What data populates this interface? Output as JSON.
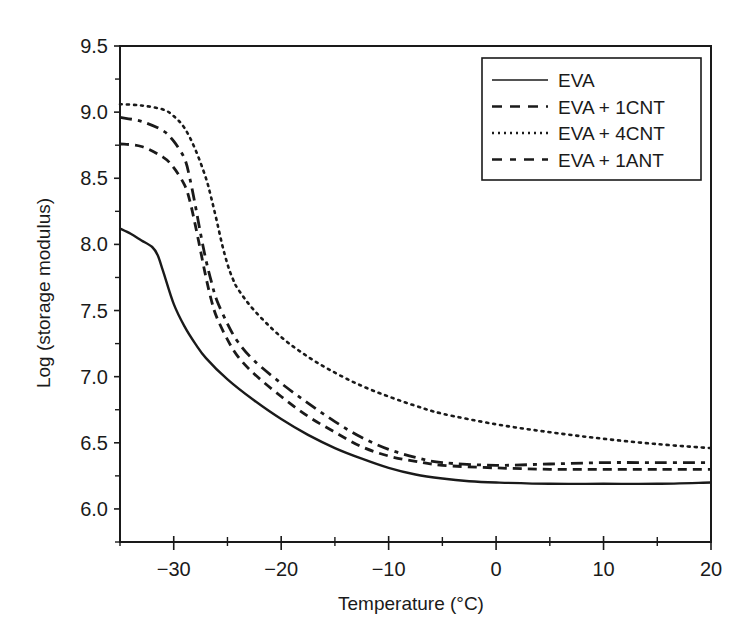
{
  "chart_data": {
    "type": "line",
    "title": "",
    "xlabel": "Temperature (°C)",
    "ylabel": "Log (storage modulus)",
    "xlim": [
      -35,
      20
    ],
    "ylim": [
      5.75,
      9.5
    ],
    "xticks": [
      -30,
      -20,
      -10,
      0,
      10,
      20
    ],
    "xtick_labels": [
      "−30",
      "−20",
      "−10",
      "0",
      "10",
      "20"
    ],
    "yticks": [
      6.0,
      6.5,
      7.0,
      7.5,
      8.0,
      8.5,
      9.0,
      9.5
    ],
    "ytick_labels": [
      "6.0",
      "6.5",
      "7.0",
      "7.5",
      "8.0",
      "8.5",
      "9.0",
      "9.5"
    ],
    "grid": false,
    "legend_position": "upper right",
    "series": [
      {
        "name": "EVA",
        "style": "solid",
        "x": [
          -35,
          -34,
          -33,
          -32,
          -31.5,
          -31,
          -30,
          -29,
          -28,
          -27,
          -25,
          -22.5,
          -20,
          -17.5,
          -15,
          -12.5,
          -10,
          -7.5,
          -5,
          -2.5,
          0,
          5,
          10,
          15,
          20
        ],
        "y": [
          8.12,
          8.08,
          8.03,
          7.98,
          7.92,
          7.8,
          7.55,
          7.38,
          7.25,
          7.14,
          6.98,
          6.82,
          6.68,
          6.56,
          6.46,
          6.38,
          6.31,
          6.26,
          6.23,
          6.21,
          6.2,
          6.19,
          6.19,
          6.19,
          6.2
        ]
      },
      {
        "name": "EVA + 1CNT",
        "style": "dashed",
        "x": [
          -35,
          -33,
          -31,
          -30,
          -29,
          -28.5,
          -28,
          -27.5,
          -27,
          -26.5,
          -26,
          -25,
          -24,
          -22.5,
          -20,
          -17.5,
          -15,
          -12.5,
          -10,
          -7.5,
          -5,
          0,
          5,
          10,
          15,
          20
        ],
        "y": [
          8.76,
          8.74,
          8.66,
          8.58,
          8.45,
          8.33,
          8.15,
          7.95,
          7.75,
          7.58,
          7.45,
          7.28,
          7.15,
          7.02,
          6.85,
          6.7,
          6.58,
          6.47,
          6.4,
          6.36,
          6.33,
          6.31,
          6.3,
          6.3,
          6.3,
          6.3
        ]
      },
      {
        "name": "EVA + 4CNT",
        "style": "dotted",
        "x": [
          -35,
          -33,
          -31,
          -30,
          -29,
          -28,
          -27,
          -26.5,
          -26,
          -25.5,
          -25,
          -24.5,
          -24,
          -22.5,
          -20,
          -17.5,
          -15,
          -12.5,
          -10,
          -7.5,
          -5,
          0,
          5,
          10,
          15,
          20
        ],
        "y": [
          9.06,
          9.05,
          9.02,
          8.97,
          8.88,
          8.72,
          8.5,
          8.35,
          8.18,
          8.0,
          7.85,
          7.74,
          7.66,
          7.5,
          7.3,
          7.15,
          7.03,
          6.93,
          6.85,
          6.78,
          6.72,
          6.64,
          6.58,
          6.53,
          6.49,
          6.46
        ]
      },
      {
        "name": "EVA + 1ANT",
        "style": "dash-dot",
        "x": [
          -35,
          -33,
          -31,
          -30,
          -29,
          -28.5,
          -28,
          -27.5,
          -27,
          -26.5,
          -26,
          -25,
          -24,
          -22.5,
          -20,
          -17.5,
          -15,
          -12.5,
          -10,
          -7.5,
          -5,
          0,
          5,
          10,
          15,
          20
        ],
        "y": [
          8.96,
          8.93,
          8.86,
          8.78,
          8.65,
          8.5,
          8.3,
          8.08,
          7.88,
          7.72,
          7.58,
          7.4,
          7.26,
          7.12,
          6.95,
          6.8,
          6.66,
          6.54,
          6.45,
          6.39,
          6.35,
          6.33,
          6.34,
          6.35,
          6.35,
          6.35
        ]
      }
    ]
  },
  "legend": {
    "items": [
      {
        "label": "EVA",
        "style": "solid"
      },
      {
        "label": "EVA + 1CNT",
        "style": "dashed"
      },
      {
        "label": "EVA + 4CNT",
        "style": "dotted"
      },
      {
        "label": "EVA + 1ANT",
        "style": "dash-dot"
      }
    ]
  },
  "colors": {
    "ink": "#1a1a1a",
    "background": "#ffffff"
  }
}
